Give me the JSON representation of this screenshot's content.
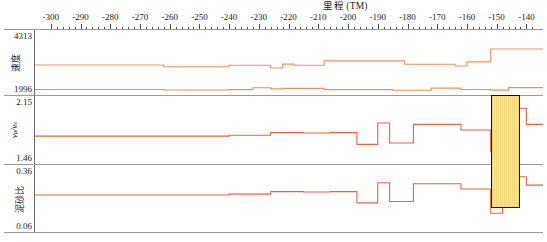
{
  "axis": {
    "title": "里程 (TM)",
    "tick_labels": [
      -300,
      -290,
      -280,
      -270,
      -260,
      -250,
      -240,
      -230,
      -220,
      -210,
      -200,
      -190,
      -180,
      -170,
      -160,
      -150,
      -140
    ],
    "tick_label_text": [
      "-300",
      "-290",
      "-280",
      "-270",
      "-260",
      "-250",
      "-240",
      "-230",
      "-220",
      "-210",
      "-200",
      "-190",
      "-180",
      "-170",
      "-160",
      "-150",
      "-140"
    ],
    "range": [
      -305.3,
      -134.4
    ],
    "px_per_unit": 3.2
  },
  "panels": [
    {
      "id": "velocity",
      "label": "速度",
      "label_kind": "cjk",
      "max": "4313",
      "min": "1996",
      "ymax": 4313,
      "ymin": 1996
    },
    {
      "id": "vpvs",
      "label": "vₚ/vₛ",
      "label_kind": "latin",
      "max": "2.15",
      "min": "1.46",
      "ymax": 2.15,
      "ymin": 1.46
    },
    {
      "id": "sandmudratio",
      "label": "泥砂比",
      "label_kind": "cjk",
      "max": "0.36",
      "min": "0.06",
      "ymax": 0.36,
      "ymin": 0.06
    }
  ],
  "colors": {
    "curve_primary": "#e8643c",
    "curve_secondary": "#ef8f63",
    "highlight_fill": "#f2d87a",
    "highlight_border": "#111111",
    "grid": "#9a9a9a"
  },
  "highlight": {
    "label": "highlight-region",
    "x_start": -152.0,
    "x_end": -142.0
  },
  "chart_data": {
    "type": "line",
    "title": "里程 (TM)",
    "xlabel": "里程 (TM)",
    "grid": false,
    "legend": "none",
    "xlim": [
      -305.3,
      -134.4
    ],
    "series": [
      {
        "name": "速度-upper",
        "panel": "velocity",
        "style": "step",
        "color": "#ef8f63",
        "ylim": [
          1996,
          4313
        ],
        "points": [
          [
            -305.3,
            3050
          ],
          [
            -262.0,
            3050
          ],
          [
            -262.0,
            2985
          ],
          [
            -240.0,
            2985
          ],
          [
            -240.0,
            3040
          ],
          [
            -226.0,
            3040
          ],
          [
            -226.0,
            2930
          ],
          [
            -222.0,
            2930
          ],
          [
            -222.0,
            3090
          ],
          [
            -218.0,
            3090
          ],
          [
            -218.0,
            3040
          ],
          [
            -208.0,
            3040
          ],
          [
            -208.0,
            3220
          ],
          [
            -181.0,
            3220
          ],
          [
            -181.0,
            3085
          ],
          [
            -167.0,
            3085
          ],
          [
            -167.0,
            3085
          ],
          [
            -164.0,
            3085
          ],
          [
            -164.0,
            3015
          ],
          [
            -160.0,
            3015
          ],
          [
            -160.0,
            3180
          ],
          [
            -152.0,
            3180
          ],
          [
            -152.0,
            3700
          ],
          [
            -134.4,
            3700
          ]
        ]
      },
      {
        "name": "速度-lower",
        "panel": "velocity",
        "style": "step",
        "color": "#ef8f63",
        "ylim": [
          1996,
          4313
        ],
        "points": [
          [
            -305.3,
            2060
          ],
          [
            -262.0,
            2060
          ],
          [
            -262.0,
            2040
          ],
          [
            -240.0,
            2040
          ],
          [
            -240.0,
            2055
          ],
          [
            -232.0,
            2055
          ],
          [
            -232.0,
            2130
          ],
          [
            -226.0,
            2130
          ],
          [
            -226.0,
            2085
          ],
          [
            -222.0,
            2085
          ],
          [
            -222.0,
            2105
          ],
          [
            -208.0,
            2105
          ],
          [
            -208.0,
            2055
          ],
          [
            -185.0,
            2055
          ],
          [
            -185.0,
            2030
          ],
          [
            -172.0,
            2030
          ],
          [
            -172.0,
            2115
          ],
          [
            -162.0,
            2115
          ],
          [
            -162.0,
            2060
          ],
          [
            -152.0,
            2060
          ],
          [
            -152.0,
            2035
          ],
          [
            -146.0,
            2035
          ],
          [
            -146.0,
            2135
          ],
          [
            -134.4,
            2135
          ]
        ]
      },
      {
        "name": "vp/vs",
        "panel": "vpvs",
        "style": "step",
        "color": "#e8643c",
        "ylim": [
          1.46,
          2.15
        ],
        "points": [
          [
            -305.3,
            1.735
          ],
          [
            -240.0,
            1.735
          ],
          [
            -240.0,
            1.745
          ],
          [
            -226.0,
            1.745
          ],
          [
            -226.0,
            1.775
          ],
          [
            -215.0,
            1.775
          ],
          [
            -215.0,
            1.77
          ],
          [
            -206.0,
            1.77
          ],
          [
            -206.0,
            1.775
          ],
          [
            -197.0,
            1.775
          ],
          [
            -197.0,
            1.64
          ],
          [
            -190.0,
            1.64
          ],
          [
            -190.0,
            1.885
          ],
          [
            -186.0,
            1.885
          ],
          [
            -186.0,
            1.655
          ],
          [
            -178.0,
            1.655
          ],
          [
            -178.0,
            1.87
          ],
          [
            -162.0,
            1.87
          ],
          [
            -162.0,
            1.805
          ],
          [
            -152.0,
            1.805
          ],
          [
            -152.0,
            1.555
          ],
          [
            -148.0,
            1.555
          ],
          [
            -148.0,
            1.7
          ],
          [
            -143.0,
            1.7
          ],
          [
            -143.0,
            2.055
          ],
          [
            -140.0,
            2.055
          ],
          [
            -140.0,
            1.87
          ],
          [
            -134.4,
            1.87
          ]
        ]
      },
      {
        "name": "泥砂比",
        "panel": "sandmudratio",
        "style": "step",
        "color": "#e8643c",
        "ylim": [
          0.06,
          0.36
        ],
        "points": [
          [
            -305.3,
            0.228
          ],
          [
            -240.0,
            0.228
          ],
          [
            -240.0,
            0.232
          ],
          [
            -226.0,
            0.232
          ],
          [
            -226.0,
            0.245
          ],
          [
            -215.0,
            0.245
          ],
          [
            -215.0,
            0.243
          ],
          [
            -206.0,
            0.243
          ],
          [
            -206.0,
            0.245
          ],
          [
            -197.0,
            0.245
          ],
          [
            -197.0,
            0.188
          ],
          [
            -190.0,
            0.188
          ],
          [
            -190.0,
            0.29
          ],
          [
            -186.0,
            0.29
          ],
          [
            -186.0,
            0.195
          ],
          [
            -178.0,
            0.195
          ],
          [
            -178.0,
            0.285
          ],
          [
            -162.0,
            0.285
          ],
          [
            -162.0,
            0.258
          ],
          [
            -152.0,
            0.258
          ],
          [
            -152.0,
            0.135
          ],
          [
            -148.0,
            0.135
          ],
          [
            -148.0,
            0.225
          ],
          [
            -143.0,
            0.225
          ],
          [
            -143.0,
            0.32
          ],
          [
            -140.0,
            0.32
          ],
          [
            -140.0,
            0.278
          ],
          [
            -134.4,
            0.278
          ]
        ]
      }
    ]
  }
}
